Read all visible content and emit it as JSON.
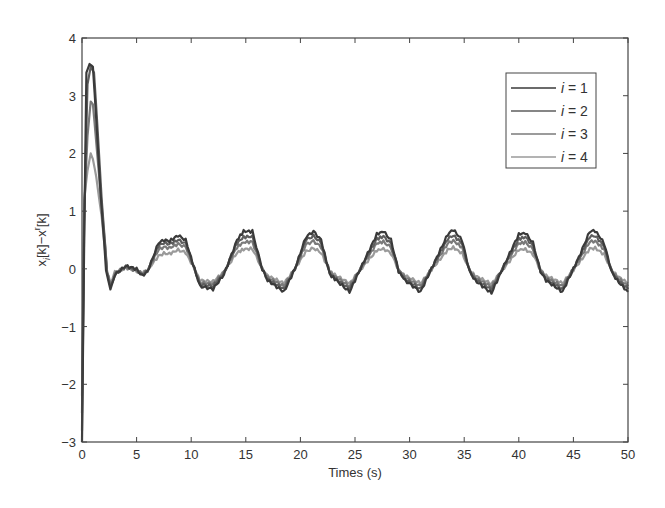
{
  "chart_data": {
    "type": "line",
    "title": "",
    "xlabel": "Times (s)",
    "ylabel": "x_i[k]−x^r[k]",
    "xlim": [
      0,
      50
    ],
    "ylim": [
      -3,
      4
    ],
    "xticks": [
      0,
      5,
      10,
      15,
      20,
      25,
      30,
      35,
      40,
      45,
      50
    ],
    "yticks": [
      -3,
      -2,
      -1,
      0,
      1,
      2,
      3,
      4
    ],
    "grid": false,
    "legend_position": "upper right",
    "series": [
      {
        "name": "i = 1",
        "color": "#3a3a3a",
        "points": [
          [
            0,
            -3.0
          ],
          [
            0.2,
            0.5
          ],
          [
            0.4,
            3.4
          ],
          [
            0.7,
            3.55
          ],
          [
            1.0,
            3.5
          ],
          [
            1.3,
            2.6
          ],
          [
            1.7,
            1.3
          ],
          [
            2.2,
            0.0
          ],
          [
            2.6,
            -0.38
          ],
          [
            3.0,
            -0.1
          ],
          [
            4.0,
            0.05
          ],
          [
            5.0,
            0.0
          ],
          [
            5.5,
            -0.12
          ],
          [
            6.0,
            -0.05
          ],
          [
            7.0,
            0.45
          ],
          [
            7.5,
            0.5
          ],
          [
            8.0,
            0.48
          ],
          [
            8.8,
            0.58
          ],
          [
            9.5,
            0.5
          ],
          [
            10.3,
            0.0
          ],
          [
            10.8,
            -0.3
          ],
          [
            12.0,
            -0.35
          ],
          [
            13.0,
            -0.1
          ],
          [
            14.2,
            0.5
          ],
          [
            14.8,
            0.65
          ],
          [
            15.6,
            0.65
          ],
          [
            16.5,
            0.0
          ],
          [
            17.0,
            -0.2
          ],
          [
            18.5,
            -0.4
          ],
          [
            19.5,
            0.0
          ],
          [
            20.5,
            0.55
          ],
          [
            21.2,
            0.65
          ],
          [
            21.9,
            0.5
          ],
          [
            22.7,
            -0.1
          ],
          [
            23.3,
            -0.2
          ],
          [
            24.5,
            -0.4
          ],
          [
            26.0,
            0.2
          ],
          [
            27.0,
            0.6
          ],
          [
            27.6,
            0.65
          ],
          [
            28.3,
            0.5
          ],
          [
            29.0,
            -0.05
          ],
          [
            29.6,
            -0.2
          ],
          [
            31.0,
            -0.4
          ],
          [
            32.5,
            0.2
          ],
          [
            33.5,
            0.6
          ],
          [
            34.0,
            0.68
          ],
          [
            34.8,
            0.5
          ],
          [
            35.5,
            -0.05
          ],
          [
            36.0,
            -0.2
          ],
          [
            37.5,
            -0.42
          ],
          [
            39.0,
            0.2
          ],
          [
            40.0,
            0.6
          ],
          [
            40.6,
            0.62
          ],
          [
            41.3,
            0.45
          ],
          [
            42.0,
            -0.05
          ],
          [
            42.5,
            -0.2
          ],
          [
            44.0,
            -0.4
          ],
          [
            45.5,
            0.2
          ],
          [
            46.5,
            0.65
          ],
          [
            47.0,
            0.66
          ],
          [
            47.8,
            0.45
          ],
          [
            48.5,
            -0.05
          ],
          [
            49.0,
            -0.2
          ],
          [
            50.0,
            -0.4
          ]
        ]
      },
      {
        "name": "i = 2",
        "color": "#5e5e5e",
        "points": [
          [
            0,
            -2.8
          ],
          [
            0.2,
            0.8
          ],
          [
            0.5,
            3.2
          ],
          [
            0.8,
            3.5
          ],
          [
            1.1,
            3.4
          ],
          [
            1.4,
            2.5
          ],
          [
            1.8,
            1.2
          ],
          [
            2.3,
            -0.05
          ],
          [
            2.6,
            -0.32
          ],
          [
            3.0,
            -0.1
          ],
          [
            4.0,
            0.04
          ],
          [
            5.0,
            -0.02
          ],
          [
            5.5,
            -0.1
          ],
          [
            6.0,
            -0.04
          ],
          [
            7.0,
            0.4
          ],
          [
            7.5,
            0.45
          ],
          [
            8.0,
            0.43
          ],
          [
            8.8,
            0.5
          ],
          [
            9.5,
            0.44
          ],
          [
            10.3,
            0.0
          ],
          [
            10.8,
            -0.27
          ],
          [
            12.0,
            -0.3
          ],
          [
            13.0,
            -0.08
          ],
          [
            14.2,
            0.45
          ],
          [
            14.8,
            0.55
          ],
          [
            15.6,
            0.56
          ],
          [
            16.5,
            0.0
          ],
          [
            17.0,
            -0.18
          ],
          [
            18.5,
            -0.35
          ],
          [
            19.5,
            0.0
          ],
          [
            20.5,
            0.5
          ],
          [
            21.2,
            0.57
          ],
          [
            21.9,
            0.45
          ],
          [
            22.7,
            -0.08
          ],
          [
            23.3,
            -0.18
          ],
          [
            24.5,
            -0.35
          ],
          [
            26.0,
            0.18
          ],
          [
            27.0,
            0.52
          ],
          [
            27.6,
            0.56
          ],
          [
            28.3,
            0.44
          ],
          [
            29.0,
            -0.04
          ],
          [
            29.6,
            -0.18
          ],
          [
            31.0,
            -0.35
          ],
          [
            32.5,
            0.18
          ],
          [
            33.5,
            0.52
          ],
          [
            34.0,
            0.58
          ],
          [
            34.8,
            0.44
          ],
          [
            35.5,
            -0.04
          ],
          [
            36.0,
            -0.18
          ],
          [
            37.5,
            -0.36
          ],
          [
            39.0,
            0.18
          ],
          [
            40.0,
            0.52
          ],
          [
            40.6,
            0.55
          ],
          [
            41.3,
            0.4
          ],
          [
            42.0,
            -0.04
          ],
          [
            42.5,
            -0.18
          ],
          [
            44.0,
            -0.35
          ],
          [
            45.5,
            0.18
          ],
          [
            46.5,
            0.56
          ],
          [
            47.0,
            0.57
          ],
          [
            47.8,
            0.4
          ],
          [
            48.5,
            -0.04
          ],
          [
            49.0,
            -0.18
          ],
          [
            50.0,
            -0.35
          ]
        ]
      },
      {
        "name": "i = 3",
        "color": "#7a7a7a",
        "points": [
          [
            0,
            -2.5
          ],
          [
            0.2,
            1.0
          ],
          [
            0.5,
            2.3
          ],
          [
            0.8,
            2.9
          ],
          [
            1.0,
            2.85
          ],
          [
            1.3,
            2.2
          ],
          [
            1.8,
            1.1
          ],
          [
            2.3,
            -0.05
          ],
          [
            2.6,
            -0.28
          ],
          [
            3.0,
            -0.08
          ],
          [
            4.0,
            0.03
          ],
          [
            5.0,
            -0.03
          ],
          [
            5.5,
            -0.08
          ],
          [
            6.0,
            -0.03
          ],
          [
            7.0,
            0.33
          ],
          [
            7.5,
            0.38
          ],
          [
            8.0,
            0.36
          ],
          [
            8.8,
            0.43
          ],
          [
            9.5,
            0.38
          ],
          [
            10.3,
            0.0
          ],
          [
            10.8,
            -0.24
          ],
          [
            12.0,
            -0.26
          ],
          [
            13.0,
            -0.06
          ],
          [
            14.2,
            0.38
          ],
          [
            14.8,
            0.46
          ],
          [
            15.6,
            0.47
          ],
          [
            16.5,
            0.0
          ],
          [
            17.0,
            -0.15
          ],
          [
            18.5,
            -0.3
          ],
          [
            19.5,
            0.0
          ],
          [
            20.5,
            0.42
          ],
          [
            21.2,
            0.48
          ],
          [
            21.9,
            0.38
          ],
          [
            22.7,
            -0.06
          ],
          [
            23.3,
            -0.15
          ],
          [
            24.5,
            -0.3
          ],
          [
            26.0,
            0.15
          ],
          [
            27.0,
            0.44
          ],
          [
            27.6,
            0.47
          ],
          [
            28.3,
            0.37
          ],
          [
            29.0,
            -0.03
          ],
          [
            29.6,
            -0.15
          ],
          [
            31.0,
            -0.3
          ],
          [
            32.5,
            0.15
          ],
          [
            33.5,
            0.44
          ],
          [
            34.0,
            0.49
          ],
          [
            34.8,
            0.37
          ],
          [
            35.5,
            -0.03
          ],
          [
            36.0,
            -0.15
          ],
          [
            37.5,
            -0.31
          ],
          [
            39.0,
            0.15
          ],
          [
            40.0,
            0.44
          ],
          [
            40.6,
            0.46
          ],
          [
            41.3,
            0.34
          ],
          [
            42.0,
            -0.03
          ],
          [
            42.5,
            -0.15
          ],
          [
            44.0,
            -0.3
          ],
          [
            45.5,
            0.15
          ],
          [
            46.5,
            0.47
          ],
          [
            47.0,
            0.48
          ],
          [
            47.8,
            0.34
          ],
          [
            48.5,
            -0.03
          ],
          [
            49.0,
            -0.15
          ],
          [
            50.0,
            -0.3
          ]
        ]
      },
      {
        "name": "i = 4",
        "color": "#9a9a9a",
        "points": [
          [
            0,
            -2.2
          ],
          [
            0.2,
            1.2
          ],
          [
            0.5,
            1.7
          ],
          [
            0.8,
            2.0
          ],
          [
            1.0,
            1.9
          ],
          [
            1.3,
            1.6
          ],
          [
            1.8,
            0.9
          ],
          [
            2.3,
            -0.05
          ],
          [
            2.6,
            -0.25
          ],
          [
            3.0,
            -0.06
          ],
          [
            4.0,
            0.02
          ],
          [
            5.0,
            -0.04
          ],
          [
            5.5,
            -0.07
          ],
          [
            6.0,
            -0.02
          ],
          [
            7.0,
            0.22
          ],
          [
            7.5,
            0.27
          ],
          [
            8.0,
            0.26
          ],
          [
            8.8,
            0.33
          ],
          [
            9.5,
            0.28
          ],
          [
            10.3,
            0.0
          ],
          [
            10.8,
            -0.2
          ],
          [
            12.0,
            -0.22
          ],
          [
            13.0,
            -0.05
          ],
          [
            14.2,
            0.28
          ],
          [
            14.8,
            0.34
          ],
          [
            15.6,
            0.35
          ],
          [
            16.5,
            0.0
          ],
          [
            17.0,
            -0.12
          ],
          [
            18.5,
            -0.25
          ],
          [
            19.5,
            0.0
          ],
          [
            20.5,
            0.3
          ],
          [
            21.2,
            0.36
          ],
          [
            21.9,
            0.28
          ],
          [
            22.7,
            -0.05
          ],
          [
            23.3,
            -0.12
          ],
          [
            24.5,
            -0.25
          ],
          [
            26.0,
            0.1
          ],
          [
            27.0,
            0.32
          ],
          [
            27.6,
            0.35
          ],
          [
            28.3,
            0.27
          ],
          [
            29.0,
            -0.02
          ],
          [
            29.6,
            -0.12
          ],
          [
            31.0,
            -0.25
          ],
          [
            32.5,
            0.1
          ],
          [
            33.5,
            0.33
          ],
          [
            34.0,
            0.37
          ],
          [
            34.8,
            0.27
          ],
          [
            35.5,
            -0.02
          ],
          [
            36.0,
            -0.12
          ],
          [
            37.5,
            -0.26
          ],
          [
            39.0,
            0.1
          ],
          [
            40.0,
            0.33
          ],
          [
            40.6,
            0.34
          ],
          [
            41.3,
            0.25
          ],
          [
            42.0,
            -0.02
          ],
          [
            42.5,
            -0.12
          ],
          [
            44.0,
            -0.25
          ],
          [
            45.5,
            0.1
          ],
          [
            46.5,
            0.35
          ],
          [
            47.0,
            0.36
          ],
          [
            47.8,
            0.25
          ],
          [
            48.5,
            -0.02
          ],
          [
            49.0,
            -0.12
          ],
          [
            50.0,
            -0.25
          ]
        ]
      }
    ]
  },
  "legend": {
    "items": [
      {
        "label_var": "i",
        "label_rest": " = 1"
      },
      {
        "label_var": "i",
        "label_rest": " = 2"
      },
      {
        "label_var": "i",
        "label_rest": " = 3"
      },
      {
        "label_var": "i",
        "label_rest": " = 4"
      }
    ]
  },
  "axes": {
    "xlabel": "Times (s)",
    "ylabel_main": "x",
    "ylabel_sub": "i",
    "ylabel_mid": "[k]−x",
    "ylabel_sup": "r",
    "ylabel_end": "[k]"
  }
}
